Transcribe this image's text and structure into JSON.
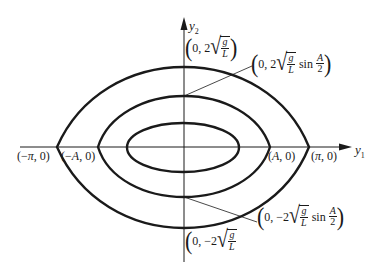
{
  "diagram": {
    "type": "phase-portrait",
    "axes": {
      "horizontal": {
        "label": "y",
        "subscript": "1"
      },
      "vertical": {
        "label": "y",
        "subscript": "2"
      }
    },
    "curves": [
      {
        "name": "outer-separatrix",
        "x_intercepts": [
          "-π",
          "π"
        ],
        "y_intercepts": [
          "2√(g/L)",
          "-2√(g/L)"
        ]
      },
      {
        "name": "middle-orbit",
        "x_intercepts": [
          "-A",
          "A"
        ],
        "y_intercepts": [
          "2√(g/L) sin(A/2)",
          "-2√(g/L) sin(A/2)"
        ]
      },
      {
        "name": "inner-orbit"
      }
    ],
    "labels": {
      "neg_pi": {
        "open": "(",
        "minus": "−",
        "var": "π",
        "rest": ", 0)"
      },
      "neg_A": {
        "open": "(",
        "minus": "−",
        "var": "A",
        "rest": ", 0)"
      },
      "pos_A": {
        "open": "(",
        "var": "A",
        "rest": ", 0)"
      },
      "pos_pi": {
        "open": "(",
        "var": "π",
        "rest": ", 0)"
      },
      "top_outer": {
        "open": "(",
        "prefix": "0, 2",
        "num": "g",
        "den": "L",
        "close": ")"
      },
      "top_middle": {
        "open": "(",
        "prefix": "0, 2",
        "num": "g",
        "den": "L",
        "fn": "sin",
        "fnum": "A",
        "fden": "2",
        "close": ")"
      },
      "bottom_middle": {
        "open": "(",
        "prefix": "0, −2",
        "num": "g",
        "den": "L",
        "fn": "sin",
        "fnum": "A",
        "fden": "2",
        "close": ")"
      },
      "bottom_outer": {
        "open": "(",
        "prefix": "0, −2",
        "num": "g",
        "den": "L",
        "close": ")"
      }
    },
    "colors": {
      "ink": "#1a1a1a",
      "background": "#ffffff"
    }
  }
}
